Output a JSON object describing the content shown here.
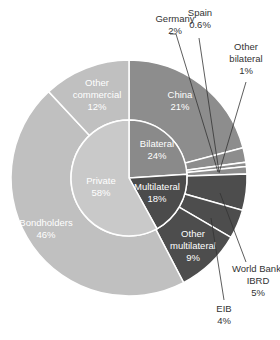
{
  "chart_data": {
    "type": "pie",
    "variant": "double-donut (sunburst)",
    "title": "",
    "inner_ring": [
      {
        "label": "Bilateral",
        "value": 24,
        "display": "24%",
        "color": "#8a8a8a"
      },
      {
        "label": "Multilateral",
        "value": 18,
        "display": "18%",
        "color": "#4b4b4b"
      },
      {
        "label": "Private",
        "value": 58,
        "display": "58%",
        "color": "#c9c9c9"
      }
    ],
    "outer_ring": [
      {
        "label": "China",
        "parent": "Bilateral",
        "value": 21,
        "display": "21%",
        "color": "#8d8d8d"
      },
      {
        "label": "Germany",
        "parent": "Bilateral",
        "value": 2,
        "display": "2%",
        "color": "#8d8d8d"
      },
      {
        "label": "Spain",
        "parent": "Bilateral",
        "value": 0.6,
        "display": "0.6%",
        "color": "#8d8d8d"
      },
      {
        "label": "Other bilateral",
        "parent": "Bilateral",
        "value": 1,
        "display": "1%",
        "color": "#8d8d8d"
      },
      {
        "label": "World Bank-IBRD",
        "parent": "Multilateral",
        "value": 5,
        "display": "5%",
        "color": "#4d4d4d"
      },
      {
        "label": "EIB",
        "parent": "Multilateral",
        "value": 4,
        "display": "4%",
        "color": "#4d4d4d"
      },
      {
        "label": "Other multilateral",
        "parent": "Multilateral",
        "value": 9,
        "display": "9%",
        "color": "#4d4d4d"
      },
      {
        "label": "Bondholders",
        "parent": "Private",
        "value": 46,
        "display": "46%",
        "color": "#c0c0c0"
      },
      {
        "label": "Other commercial",
        "parent": "Private",
        "value": 12,
        "display": "12%",
        "color": "#c0c0c0"
      }
    ],
    "legend": "none (callout labels)",
    "start_angle": "12 o'clock, clockwise"
  }
}
